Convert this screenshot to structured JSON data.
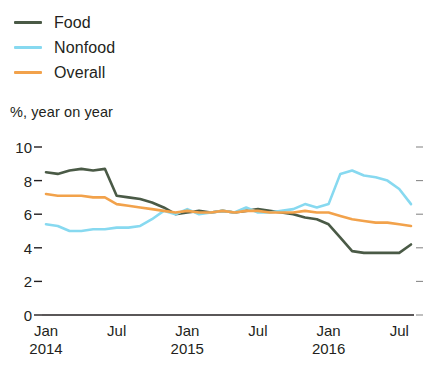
{
  "legend": {
    "position": "top-left",
    "items": [
      {
        "label": "Food",
        "color": "#4a5a46"
      },
      {
        "label": "Nonfood",
        "color": "#87d9f0"
      },
      {
        "label": "Overall",
        "color": "#f2a24b"
      }
    ]
  },
  "axis_note": "%, year on year",
  "chart_data": {
    "type": "line",
    "title": "",
    "subtitle": "",
    "xlabel": "",
    "ylabel": "%, year on year",
    "ylim": [
      0,
      10
    ],
    "yticks": [
      0,
      2,
      4,
      6,
      8,
      10
    ],
    "ytick_labels": [
      "0",
      "2",
      "4",
      "6",
      "8",
      "10"
    ],
    "grid": false,
    "legend_position": "top-left",
    "x": [
      "Jan 2014",
      "Feb 2014",
      "Mar 2014",
      "Apr 2014",
      "May 2014",
      "Jun 2014",
      "Jul 2014",
      "Aug 2014",
      "Sep 2014",
      "Oct 2014",
      "Nov 2014",
      "Dec 2014",
      "Jan 2015",
      "Feb 2015",
      "Mar 2015",
      "Apr 2015",
      "May 2015",
      "Jun 2015",
      "Jul 2015",
      "Aug 2015",
      "Sep 2015",
      "Oct 2015",
      "Nov 2015",
      "Dec 2015",
      "Jan 2016",
      "Feb 2016",
      "Mar 2016",
      "Apr 2016",
      "May 2016",
      "Jun 2016",
      "Jul 2016",
      "Aug 2016"
    ],
    "xtick_labels": [
      {
        "top": "Jan",
        "bottom": "2014",
        "index": 0
      },
      {
        "top": "Jul",
        "bottom": "",
        "index": 6
      },
      {
        "top": "Jan",
        "bottom": "2015",
        "index": 12
      },
      {
        "top": "Jul",
        "bottom": "",
        "index": 18
      },
      {
        "top": "Jan",
        "bottom": "2016",
        "index": 24
      },
      {
        "top": "Jul",
        "bottom": "",
        "index": 30
      }
    ],
    "series": [
      {
        "name": "Food",
        "color": "#4a5a46",
        "values": [
          8.5,
          8.4,
          8.6,
          8.7,
          8.6,
          8.7,
          7.1,
          7.0,
          6.9,
          6.7,
          6.4,
          6.0,
          6.1,
          6.2,
          6.1,
          6.2,
          6.1,
          6.2,
          6.3,
          6.2,
          6.1,
          6.0,
          5.8,
          5.7,
          5.4,
          4.6,
          3.8,
          3.7,
          3.7,
          3.7,
          3.7,
          4.2
        ]
      },
      {
        "name": "Nonfood",
        "color": "#87d9f0",
        "values": [
          5.4,
          5.3,
          5.0,
          5.0,
          5.1,
          5.1,
          5.2,
          5.2,
          5.3,
          5.7,
          6.2,
          6.0,
          6.3,
          6.0,
          6.1,
          6.2,
          6.1,
          6.4,
          6.1,
          6.1,
          6.2,
          6.3,
          6.6,
          6.4,
          6.6,
          8.4,
          8.6,
          8.3,
          8.2,
          8.0,
          7.5,
          6.6
        ]
      },
      {
        "name": "Overall",
        "color": "#f2a24b",
        "values": [
          7.2,
          7.1,
          7.1,
          7.1,
          7.0,
          7.0,
          6.6,
          6.5,
          6.4,
          6.3,
          6.2,
          6.1,
          6.2,
          6.1,
          6.1,
          6.2,
          6.1,
          6.2,
          6.2,
          6.1,
          6.1,
          6.1,
          6.2,
          6.1,
          6.1,
          5.9,
          5.7,
          5.6,
          5.5,
          5.5,
          5.4,
          5.3
        ]
      }
    ]
  }
}
